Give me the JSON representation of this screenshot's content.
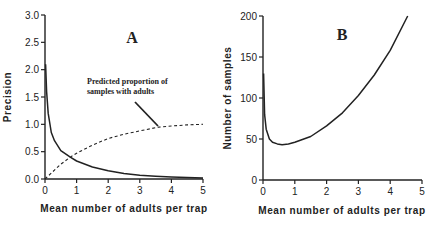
{
  "chart_data": [
    {
      "type": "line",
      "panel": "A",
      "title": "A",
      "xlabel": "Mean number of adults per trap",
      "ylabel": "Precision",
      "xlim": [
        0,
        5
      ],
      "ylim": [
        0,
        3.0
      ],
      "xticks": [
        "0",
        "1",
        "2",
        "3",
        "4",
        "5"
      ],
      "yticks": [
        "0.0",
        "0.5",
        "1.0",
        "1.5",
        "2.0",
        "2.5",
        "3.0"
      ],
      "grid": false,
      "annotation": "Predicted proportion of samples with adults",
      "series": [
        {
          "name": "Precision",
          "style": "solid",
          "x": [
            0.02,
            0.05,
            0.1,
            0.2,
            0.3,
            0.5,
            0.8,
            1.0,
            1.5,
            2.0,
            2.5,
            3.0,
            3.5,
            4.0,
            4.5,
            5.0
          ],
          "y": [
            2.1,
            1.6,
            1.2,
            0.85,
            0.7,
            0.52,
            0.4,
            0.33,
            0.22,
            0.15,
            0.1,
            0.07,
            0.05,
            0.035,
            0.025,
            0.02
          ]
        },
        {
          "name": "Predicted proportion of samples with adults",
          "style": "dashed",
          "x": [
            0,
            0.5,
            0.8,
            1.0,
            1.5,
            2.0,
            2.5,
            3.0,
            3.6,
            4.0,
            4.5,
            5.0
          ],
          "y": [
            0.0,
            0.27,
            0.4,
            0.47,
            0.62,
            0.74,
            0.82,
            0.88,
            0.95,
            0.97,
            0.99,
            1.0
          ]
        }
      ]
    },
    {
      "type": "line",
      "panel": "B",
      "title": "B",
      "xlabel": "Mean number of adults per trap",
      "ylabel": "Number of samples",
      "xlim": [
        0,
        5
      ],
      "ylim": [
        0,
        200
      ],
      "xticks": [
        "0",
        "1",
        "2",
        "3",
        "4",
        "5"
      ],
      "yticks": [
        "0",
        "50",
        "100",
        "150",
        "200"
      ],
      "grid": false,
      "series": [
        {
          "name": "Number of samples",
          "style": "solid",
          "x": [
            0.02,
            0.05,
            0.1,
            0.2,
            0.3,
            0.45,
            0.6,
            0.8,
            1.0,
            1.5,
            2.0,
            2.5,
            3.0,
            3.5,
            4.0,
            4.55
          ],
          "y": [
            130,
            80,
            62,
            50,
            46,
            44,
            43,
            44,
            46,
            53,
            66,
            82,
            103,
            128,
            158,
            200
          ]
        }
      ]
    }
  ]
}
